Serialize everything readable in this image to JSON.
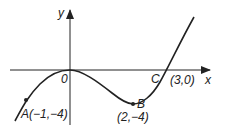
{
  "diagram": {
    "type": "cubic-graph",
    "function": "y = x^3 - 3x^2",
    "axes": {
      "x_label": "x",
      "y_label": "y",
      "origin_label": "0"
    },
    "points": [
      {
        "name": "A",
        "label": "A(−1,−4)",
        "x": -1,
        "y": -4
      },
      {
        "name": "B",
        "label": "B",
        "coords_label": "(2,−4)",
        "x": 2,
        "y": -4
      },
      {
        "name": "C",
        "label": "C",
        "coords_label": "(3,0)",
        "x": 3,
        "y": 0
      }
    ],
    "colors": {
      "stroke": "#222222",
      "background": "#ffffff"
    }
  }
}
